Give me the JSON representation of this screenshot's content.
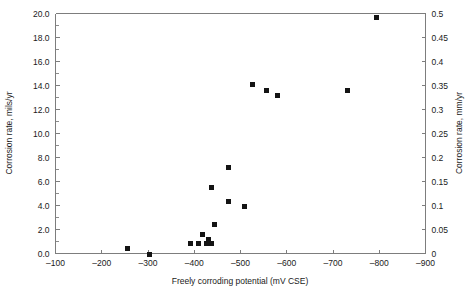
{
  "chart_data": {
    "type": "scatter",
    "title": "",
    "xlabel": "Freely corroding potential (mV CSE)",
    "ylabel": "Corrosion rate, mils/yr",
    "y2label": "Corrosion rate, mm/yr",
    "xlim": [
      -100,
      -900
    ],
    "ylim": [
      0.0,
      20.0
    ],
    "y2lim": [
      0,
      0.5
    ],
    "x_ticks": [
      -100,
      -200,
      -300,
      -400,
      -500,
      -600,
      -700,
      -800,
      -900
    ],
    "x_tick_labels": [
      "-100",
      "-200",
      "-300",
      "-400",
      "-500",
      "-600",
      "-700",
      "-800",
      "-900"
    ],
    "y_ticks": [
      0.0,
      2.0,
      4.0,
      6.0,
      8.0,
      10.0,
      12.0,
      14.0,
      16.0,
      18.0,
      20.0
    ],
    "y_tick_labels": [
      "0.0",
      "2.0",
      "4.0",
      "6.0",
      "8.0",
      "10.0",
      "12.0",
      "14.0",
      "16.0",
      "18.0",
      "20.0"
    ],
    "y_minor_step": 1.0,
    "y2_ticks": [
      0,
      0.05,
      0.1,
      0.15,
      0.2,
      0.25,
      0.3,
      0.35,
      0.4,
      0.45,
      0.5
    ],
    "y2_tick_labels": [
      "0",
      "0.05",
      "0.1",
      "0.15",
      "0.2",
      "0.25",
      "0.3",
      "0.35",
      "0.4",
      "0.45",
      "0.5"
    ],
    "grid": false,
    "legend": "none",
    "marker_color": "#141414",
    "marker_shape": "square",
    "axis_color": "#7d7d7d",
    "points": [
      {
        "x": -255,
        "y": 0.4
      },
      {
        "x": -303,
        "y": -0.05
      },
      {
        "x": -438,
        "y": 0.8
      },
      {
        "x": -392,
        "y": 0.8
      },
      {
        "x": -410,
        "y": 0.8
      },
      {
        "x": -427,
        "y": 0.85
      },
      {
        "x": -430,
        "y": 1.15
      },
      {
        "x": -418,
        "y": 1.6
      },
      {
        "x": -444,
        "y": 2.45
      },
      {
        "x": -437,
        "y": 5.5
      },
      {
        "x": -474,
        "y": 4.3
      },
      {
        "x": -508,
        "y": 3.9
      },
      {
        "x": -474,
        "y": 7.15
      },
      {
        "x": -527,
        "y": 14.1
      },
      {
        "x": -556,
        "y": 13.6
      },
      {
        "x": -580,
        "y": 13.2
      },
      {
        "x": -731,
        "y": 13.6
      },
      {
        "x": -795,
        "y": 19.7
      }
    ]
  }
}
